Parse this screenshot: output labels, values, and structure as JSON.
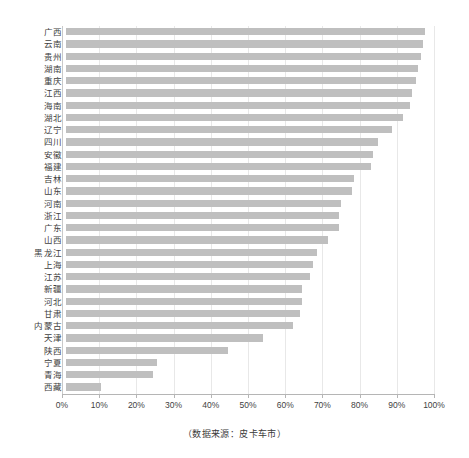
{
  "chart_data": {
    "type": "bar",
    "orientation": "horizontal",
    "title": "",
    "subtitle": "",
    "xlabel": "",
    "ylabel": "",
    "xlim": [
      0,
      100
    ],
    "xtick_labels": [
      "0%",
      "10%",
      "20%",
      "30%",
      "40%",
      "50%",
      "60%",
      "70%",
      "80%",
      "90%",
      "100%"
    ],
    "xtick_values": [
      0,
      10,
      20,
      30,
      40,
      50,
      60,
      70,
      80,
      90,
      100
    ],
    "unit": "%",
    "grid": "vertical",
    "legend": "none",
    "series_color": "#bfbfbf",
    "categories": [
      "广西",
      "云南",
      "贵州",
      "湖南",
      "重庆",
      "江西",
      "海南",
      "湖北",
      "辽宁",
      "四川",
      "安徽",
      "福建",
      "吉林",
      "山东",
      "河南",
      "浙江",
      "广东",
      "山西",
      "黑龙江",
      "上海",
      "江苏",
      "新疆",
      "河北",
      "甘肃",
      "内蒙古",
      "天津",
      "陕西",
      "宁夏",
      "青海",
      "西藏"
    ],
    "values": [
      96.5,
      96.0,
      95.5,
      94.5,
      94.0,
      93.0,
      92.5,
      90.5,
      87.5,
      84.0,
      82.5,
      82.0,
      77.5,
      77.0,
      74.0,
      73.5,
      73.5,
      70.5,
      67.5,
      66.5,
      65.5,
      63.5,
      63.5,
      63.0,
      61.0,
      53.0,
      43.5,
      24.5,
      23.5,
      9.5
    ],
    "data_labels_shown": false,
    "caption": "（数据来源：皮卡车市）"
  },
  "footer": {
    "source_caption": "（数据来源：皮卡车市）"
  }
}
